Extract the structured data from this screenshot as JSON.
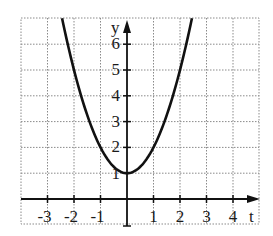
{
  "chart_data": {
    "type": "line",
    "title": "",
    "xlabel": "t",
    "ylabel": "y",
    "function": "y = t^2 + 1",
    "xlim": [
      -3.0,
      5.0
    ],
    "ylim": [
      -1.0,
      7.0
    ],
    "grid": true,
    "grid_style": "dotted",
    "x_ticks": [
      -3,
      -2,
      -1,
      1,
      2,
      3,
      4
    ],
    "x_tick_labels": [
      "-3",
      "-2",
      "-1",
      "1",
      "2",
      "3",
      "4"
    ],
    "y_ticks": [
      1,
      2,
      3,
      4,
      5,
      6
    ],
    "y_tick_labels": [
      "1",
      "2",
      "3",
      "4",
      "5",
      "6"
    ],
    "series": [
      {
        "name": "parabola",
        "x": [
          -2.45,
          -2,
          -1.5,
          -1,
          -0.5,
          0,
          0.5,
          1,
          1.5,
          2,
          2.45
        ],
        "values": [
          7.0,
          5,
          3.25,
          2,
          1.25,
          1,
          1.25,
          2,
          3.25,
          5,
          7.0
        ],
        "color": "#111111"
      }
    ]
  },
  "axes": {
    "x_label": "t",
    "y_label": "y"
  },
  "colors": {
    "curve": "#111111",
    "axis": "#111111",
    "grid": "#8a8a8a",
    "background": "#ffffff"
  }
}
